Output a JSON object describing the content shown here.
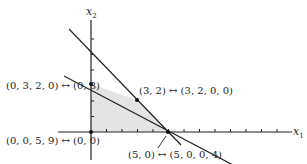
{
  "axes": {
    "x_label": "x",
    "x_sub": "1",
    "y_label": "x",
    "y_sub": "2"
  },
  "constraints": [
    {
      "name": "steep-line",
      "equation": "x1 + x2 = 5"
    },
    {
      "name": "shallow-line",
      "equation": "x1 + 3x2 = 9"
    }
  ],
  "feasible_region": {
    "fill": "#e6e6e6",
    "vertices": [
      [
        0,
        0
      ],
      [
        0,
        3
      ],
      [
        3,
        2
      ],
      [
        5,
        0
      ]
    ]
  },
  "points": [
    {
      "label": "(0, 3, 2, 0) ↔ (0, 3)",
      "coord": [
        0,
        3
      ]
    },
    {
      "label": "(3, 2) ↔ (3, 2, 0, 0)",
      "coord": [
        3,
        2
      ]
    },
    {
      "label": "(0, 0, 5, 9) ↔ (0, 0)",
      "coord": [
        0,
        0
      ]
    },
    {
      "label": "(5, 0) ↔ (5, 0, 0, 4)",
      "coord": [
        5,
        0
      ]
    }
  ]
}
